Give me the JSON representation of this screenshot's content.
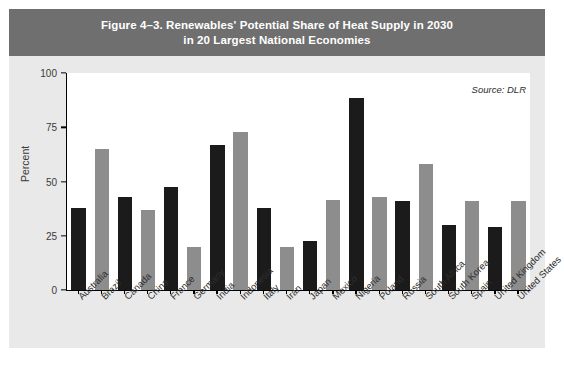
{
  "figure": {
    "title": "Figure 4–3. Renewables' Potential Share of Heat Supply in 2030\nin 20 Largest National Economies",
    "source_note": "Source: DLR",
    "banner_color": "#6f6f6f",
    "panel_color": "#e9e9e9",
    "bar_color_dark": "#1b1b1b",
    "bar_color_light": "#8d8d8d"
  },
  "chart_data": {
    "type": "bar",
    "title": "Figure 4–3. Renewables' Potential Share of Heat Supply in 2030 in 20 Largest National Economies",
    "xlabel": "",
    "ylabel": "Percent",
    "ylim": [
      0,
      100
    ],
    "yticks": [
      0,
      25,
      50,
      75,
      100
    ],
    "ytick_labels": [
      "0",
      "25",
      "50",
      "75",
      "100"
    ],
    "grid": false,
    "legend": "none",
    "annotations": [
      "Source: DLR"
    ],
    "categories": [
      "Australia",
      "Brazil",
      "Canada",
      "China",
      "France",
      "Germany",
      "India",
      "Indonesia",
      "Italy",
      "Iran",
      "Japan",
      "Mexico",
      "Nigeria",
      "Poland",
      "Russia",
      "South Africa",
      "South Korea",
      "Spain",
      "United Kingdom",
      "United States"
    ],
    "values": [
      38,
      65,
      43,
      37,
      47.5,
      20,
      67,
      73,
      38,
      20,
      22.5,
      41.5,
      88.5,
      43,
      41,
      58,
      30,
      41,
      29,
      41
    ],
    "bar_colors": [
      "#1b1b1b",
      "#8d8d8d",
      "#1b1b1b",
      "#8d8d8d",
      "#1b1b1b",
      "#8d8d8d",
      "#1b1b1b",
      "#8d8d8d",
      "#1b1b1b",
      "#8d8d8d",
      "#1b1b1b",
      "#8d8d8d",
      "#1b1b1b",
      "#8d8d8d",
      "#1b1b1b",
      "#8d8d8d",
      "#1b1b1b",
      "#8d8d8d",
      "#1b1b1b",
      "#8d8d8d"
    ]
  }
}
